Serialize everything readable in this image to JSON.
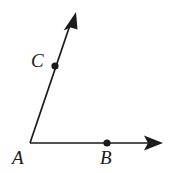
{
  "figure": {
    "type": "geometry-angle-diagram",
    "background_color": "#ffffff",
    "stroke_color": "#1a1a1a",
    "width": 173,
    "height": 173,
    "vertex": {
      "name": "A",
      "x": 30,
      "y": 143
    },
    "rays": [
      {
        "name": "ray-AB",
        "from": {
          "x": 30,
          "y": 143
        },
        "to": {
          "x": 163,
          "y": 143
        },
        "arrowhead": "end",
        "direction": "right"
      },
      {
        "name": "ray-AC",
        "from": {
          "x": 30,
          "y": 143
        },
        "to": {
          "x": 76,
          "y": 12
        },
        "arrowhead": "end",
        "direction": "up-right"
      }
    ],
    "points": [
      {
        "name": "A",
        "label": "A",
        "x": 30,
        "y": 143,
        "dot": false,
        "label_x": 12,
        "label_y": 148
      },
      {
        "name": "B",
        "label": "B",
        "x": 107,
        "y": 143,
        "dot": true,
        "label_x": 100,
        "label_y": 148
      },
      {
        "name": "C",
        "label": "C",
        "x": 55,
        "y": 66,
        "dot": true,
        "label_x": 31,
        "label_y": 51
      }
    ],
    "labels": {
      "A": "A",
      "B": "B",
      "C": "C"
    }
  }
}
